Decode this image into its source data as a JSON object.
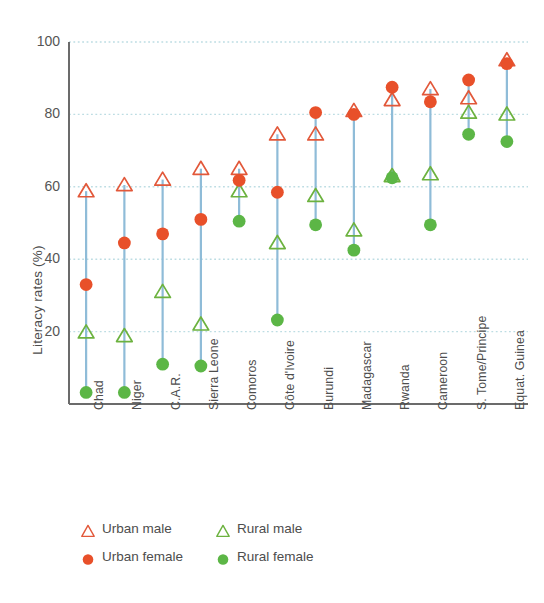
{
  "chart_data": {
    "type": "scatter",
    "title": "",
    "xlabel": "",
    "ylabel": "Literacy rates (%)",
    "ylim": [
      0,
      100
    ],
    "yticks": [
      0,
      20,
      40,
      60,
      80,
      100
    ],
    "ytick_labels": [
      "0",
      "20",
      "40",
      "60",
      "80",
      "100"
    ],
    "grid": "horizontal-dotted",
    "legend_position": "below-axes",
    "categories": [
      "Chad",
      "Niger",
      "C.A.R.",
      "Sierra Leone",
      "Comoros",
      "Côte d'Ivoire",
      "Burundi",
      "Madagascar",
      "Rwanda",
      "Cameroon",
      "S. Tome/Principe",
      "Equat. Guinea"
    ],
    "series": [
      {
        "name": "Urban male",
        "marker": "triangle-open",
        "color": "#e2583a",
        "values": [
          58.8,
          60.5,
          62.0,
          65.0,
          65.0,
          74.5,
          74.5,
          81.0,
          84.0,
          87.0,
          84.5,
          95.0
        ]
      },
      {
        "name": "Urban female",
        "marker": "circle-filled",
        "color": "#e8502a",
        "values": [
          33.0,
          44.5,
          47.0,
          51.0,
          61.8,
          58.5,
          80.5,
          80.0,
          87.5,
          83.5,
          89.5,
          94.0
        ]
      },
      {
        "name": "Rural male",
        "marker": "triangle-open",
        "color": "#6cb23f",
        "values": [
          19.8,
          18.8,
          31.0,
          22.0,
          58.8,
          44.5,
          57.5,
          48.0,
          63.0,
          63.5,
          80.5,
          80.0
        ]
      },
      {
        "name": "Rural female",
        "marker": "circle-filled",
        "color": "#5cb646",
        "values": [
          3.2,
          3.2,
          11.0,
          10.5,
          50.5,
          23.2,
          49.5,
          42.5,
          62.5,
          49.5,
          74.5,
          72.5
        ]
      }
    ],
    "connector_color": "#8fbcd8",
    "gridline_color": "#bddde3"
  },
  "legend": {
    "items": [
      {
        "label": "Urban male",
        "marker": "triangle-open",
        "color": "#e2583a"
      },
      {
        "label": "Rural male",
        "marker": "triangle-open",
        "color": "#6cb23f"
      },
      {
        "label": "Urban female",
        "marker": "circle-filled",
        "color": "#e8502a"
      },
      {
        "label": "Rural female",
        "marker": "circle-filled",
        "color": "#5cb646"
      }
    ]
  }
}
